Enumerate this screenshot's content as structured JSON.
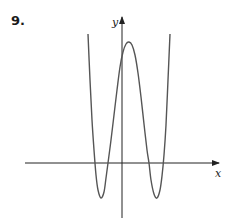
{
  "problem_number": "9.",
  "colors": {
    "axis": "#222222",
    "curve": "#555555"
  },
  "chart_data": {
    "type": "line",
    "title": "",
    "xlabel": "x",
    "ylabel": "y",
    "grid": false,
    "ticks": "none",
    "pixel_frame": {
      "origin": [
        122,
        163
      ],
      "x_axis": [
        25,
        219
      ],
      "y_axis_top": 17,
      "y_axis_bottom": 218
    },
    "points_px": [
      [
        88,
        34
      ],
      [
        90,
        80
      ],
      [
        92,
        120
      ],
      [
        94,
        150
      ],
      [
        96,
        175
      ],
      [
        98,
        190
      ],
      [
        101,
        198
      ],
      [
        104,
        192
      ],
      [
        106,
        178
      ],
      [
        108,
        163
      ],
      [
        111,
        140
      ],
      [
        114,
        115
      ],
      [
        117,
        90
      ],
      [
        120,
        67
      ],
      [
        123,
        52
      ],
      [
        126,
        44
      ],
      [
        129,
        42
      ],
      [
        132,
        45
      ],
      [
        135,
        55
      ],
      [
        138,
        73
      ],
      [
        141,
        97
      ],
      [
        144,
        124
      ],
      [
        147,
        150
      ],
      [
        149,
        163
      ],
      [
        151,
        180
      ],
      [
        154,
        194
      ],
      [
        157,
        198
      ],
      [
        160,
        190
      ],
      [
        162,
        176
      ],
      [
        164,
        155
      ],
      [
        166,
        125
      ],
      [
        168,
        80
      ],
      [
        170,
        34
      ]
    ],
    "features": {
      "x_intercepts_px": [
        94,
        108,
        149,
        163
      ],
      "local_minima_px": [
        [
          101,
          198
        ],
        [
          157,
          198
        ]
      ],
      "local_maximum_px": [
        129,
        42
      ],
      "y_intercept_px": [
        122,
        55
      ]
    }
  }
}
